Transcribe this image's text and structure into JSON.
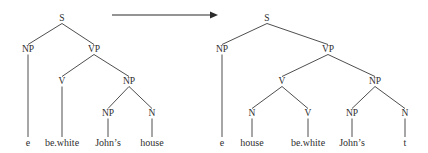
{
  "figure": {
    "kind": "syntactic-derivation",
    "arrow": {
      "label": "",
      "direction": "rightward",
      "x1": 112,
      "y1": 15,
      "x2": 218,
      "y2": 15,
      "color": "#2b2b2b"
    },
    "style": {
      "line_color": "#3a3a3a",
      "text_color": "#2e2e2e",
      "background": "#ffffff"
    }
  },
  "trees": [
    {
      "name": "source-tree",
      "nodes": [
        {
          "id": "L-S",
          "label": "S",
          "x": 62,
          "y": 21
        },
        {
          "id": "L-NP1",
          "label": "NP",
          "x": 28,
          "y": 52
        },
        {
          "id": "L-VP",
          "label": "VP",
          "x": 94,
          "y": 52
        },
        {
          "id": "L-V",
          "label": "V",
          "x": 62,
          "y": 84
        },
        {
          "id": "L-NP2",
          "label": "NP",
          "x": 129,
          "y": 84
        },
        {
          "id": "L-NP3",
          "label": "NP",
          "x": 108,
          "y": 116
        },
        {
          "id": "L-N",
          "label": "N",
          "x": 152,
          "y": 116
        }
      ],
      "edges": [
        {
          "from": "L-S",
          "to": "L-NP1"
        },
        {
          "from": "L-S",
          "to": "L-VP"
        },
        {
          "from": "L-VP",
          "to": "L-V"
        },
        {
          "from": "L-VP",
          "to": "L-NP2"
        },
        {
          "from": "L-NP2",
          "to": "L-NP3"
        },
        {
          "from": "L-NP2",
          "to": "L-N"
        }
      ],
      "leaves": [
        {
          "id": "L-leaf-e",
          "label": "e",
          "x": 28,
          "y": 146,
          "parent": "L-NP1"
        },
        {
          "id": "L-leaf-bewhite",
          "label": "be.white",
          "x": 62,
          "y": 146,
          "parent": "L-V"
        },
        {
          "id": "L-leaf-johns",
          "label": "John’s",
          "x": 108,
          "y": 146,
          "parent": "L-NP3"
        },
        {
          "id": "L-leaf-house",
          "label": "house",
          "x": 152,
          "y": 146,
          "parent": "L-N"
        }
      ]
    },
    {
      "name": "target-tree",
      "nodes": [
        {
          "id": "R-S",
          "label": "S",
          "x": 267,
          "y": 21
        },
        {
          "id": "R-NP1",
          "label": "NP",
          "x": 222,
          "y": 52
        },
        {
          "id": "R-VP",
          "label": "VP",
          "x": 328,
          "y": 52
        },
        {
          "id": "R-V1",
          "label": "V",
          "x": 282,
          "y": 84
        },
        {
          "id": "R-NP2",
          "label": "NP",
          "x": 375,
          "y": 84
        },
        {
          "id": "R-N1",
          "label": "N",
          "x": 252,
          "y": 116
        },
        {
          "id": "R-V2",
          "label": "V",
          "x": 308,
          "y": 116
        },
        {
          "id": "R-NP3",
          "label": "NP",
          "x": 352,
          "y": 116
        },
        {
          "id": "R-N2",
          "label": "N",
          "x": 405,
          "y": 116
        }
      ],
      "edges": [
        {
          "from": "R-S",
          "to": "R-NP1"
        },
        {
          "from": "R-S",
          "to": "R-VP"
        },
        {
          "from": "R-VP",
          "to": "R-V1"
        },
        {
          "from": "R-VP",
          "to": "R-NP2"
        },
        {
          "from": "R-V1",
          "to": "R-N1"
        },
        {
          "from": "R-V1",
          "to": "R-V2"
        },
        {
          "from": "R-NP2",
          "to": "R-NP3"
        },
        {
          "from": "R-NP2",
          "to": "R-N2"
        }
      ],
      "leaves": [
        {
          "id": "R-leaf-e",
          "label": "e",
          "x": 222,
          "y": 146,
          "parent": "R-NP1"
        },
        {
          "id": "R-leaf-house",
          "label": "house",
          "x": 252,
          "y": 146,
          "parent": "R-N1"
        },
        {
          "id": "R-leaf-bewhite",
          "label": "be.white",
          "x": 308,
          "y": 146,
          "parent": "R-V2"
        },
        {
          "id": "R-leaf-johns",
          "label": "John’s",
          "x": 352,
          "y": 146,
          "parent": "R-NP3"
        },
        {
          "id": "R-leaf-t",
          "label": "t",
          "x": 405,
          "y": 146,
          "parent": "R-N2"
        }
      ]
    }
  ]
}
